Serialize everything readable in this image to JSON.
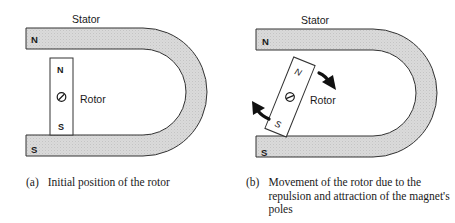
{
  "figure": {
    "colors": {
      "stator_fill": "#d8d8d8",
      "outline": "#333333",
      "text": "#1a1a1a",
      "background": "#ffffff"
    },
    "panels": [
      {
        "id": "a",
        "stator_label": "Stator",
        "stator_top_pole": "N",
        "stator_bottom_pole": "S",
        "rotor_label": "Rotor",
        "rotor_top_pole": "N",
        "rotor_bottom_pole": "S",
        "rotor_angle_deg": 0,
        "arrows": [],
        "caption_tag": "(a)",
        "caption_text": "Initial position of the rotor"
      },
      {
        "id": "b",
        "stator_label": "Stator",
        "stator_top_pole": "N",
        "stator_bottom_pole": "S",
        "rotor_label": "Rotor",
        "rotor_top_pole": "N",
        "rotor_bottom_pole": "S",
        "rotor_angle_deg": 22,
        "arrows": [
          "clockwise-arrow-top-right",
          "clockwise-arrow-bottom-left"
        ],
        "caption_tag": "(b)",
        "caption_text": "Movement of the rotor due to the repulsion and attraction of the magnet's poles"
      }
    ]
  }
}
